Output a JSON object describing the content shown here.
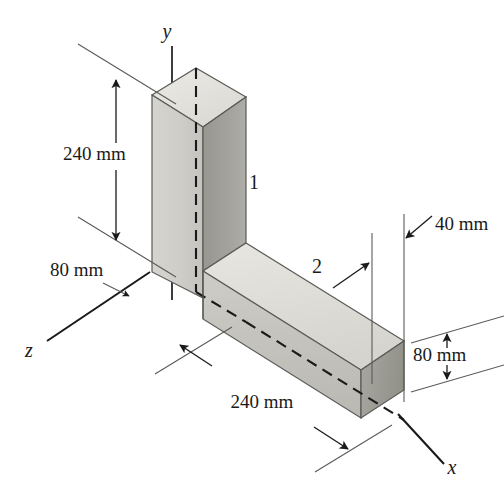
{
  "figure": {
    "background_color": "#ffffff",
    "line_color": "#1a1a1a",
    "thin_line_color": "#555555"
  },
  "axes": [
    {
      "name": "y-axis",
      "label": "y",
      "label_x": 167,
      "label_y": 33
    },
    {
      "name": "x-axis",
      "label": "x",
      "label_x": 452,
      "label_y": 469
    },
    {
      "name": "z-axis",
      "label": "z",
      "label_x": 29,
      "label_y": 352
    }
  ],
  "part_labels": [
    {
      "name": "part-1",
      "label": "1",
      "x": 254,
      "y": 184
    },
    {
      "name": "part-2",
      "label": "2",
      "x": 317,
      "y": 268
    }
  ],
  "dimensions": [
    {
      "name": "height-dimension",
      "label": "240 mm",
      "value": 240,
      "unit": "mm",
      "text_x": 63,
      "text_y": 156,
      "applies_to": "vertical prism height"
    },
    {
      "name": "depth-dimension-left",
      "label": "80 mm",
      "value": 80,
      "unit": "mm",
      "text_x": 50,
      "text_y": 272,
      "applies_to": "vertical prism depth along z"
    },
    {
      "name": "length-dimension",
      "label": "240 mm",
      "value": 240,
      "unit": "mm",
      "text_x": 262,
      "text_y": 404,
      "applies_to": "horizontal bar length along x"
    },
    {
      "name": "width-dimension",
      "label": "40 mm",
      "value": 40,
      "unit": "mm",
      "text_x": 470,
      "text_y": 226,
      "applies_to": "horizontal bar width"
    },
    {
      "name": "height-dimension-right",
      "label": "80 mm",
      "value": 80,
      "unit": "mm",
      "text_x": 477,
      "text_y": 356,
      "applies_to": "horizontal bar height"
    }
  ],
  "solids": {
    "vertical_prism": {
      "name": "vertical-prism",
      "faces": {
        "top": {
          "fill": "#e3e2de"
        },
        "front_left": {
          "fill": "#cbcac5"
        },
        "front_right": {
          "fill": "#9e9d99"
        }
      }
    },
    "horizontal_bar": {
      "name": "horizontal-bar",
      "faces": {
        "top": {
          "fill": "#dedcd7"
        },
        "front": {
          "fill": "#c2c1bc"
        },
        "end": {
          "fill": "#a2a19d"
        }
      }
    }
  }
}
